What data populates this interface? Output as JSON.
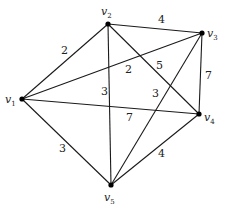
{
  "graph": {
    "type": "weighted-undirected-graph",
    "vertices": [
      {
        "id": "v1",
        "name": "v",
        "sub": "1",
        "x": 22,
        "y": 99,
        "label_x": 5,
        "label_y": 103
      },
      {
        "id": "v2",
        "name": "v",
        "sub": "2",
        "x": 108,
        "y": 24,
        "label_x": 101,
        "label_y": 15
      },
      {
        "id": "v3",
        "name": "v",
        "sub": "3",
        "x": 202,
        "y": 33,
        "label_x": 207,
        "label_y": 37
      },
      {
        "id": "v4",
        "name": "v",
        "sub": "4",
        "x": 199,
        "y": 114,
        "label_x": 204,
        "label_y": 121
      },
      {
        "id": "v5",
        "name": "v",
        "sub": "5",
        "x": 111,
        "y": 185,
        "label_x": 104,
        "label_y": 201
      }
    ],
    "edges": [
      {
        "from": "v1",
        "to": "v2",
        "weight": "2",
        "label_x": 61,
        "label_y": 54
      },
      {
        "from": "v2",
        "to": "v3",
        "weight": "4",
        "label_x": 158,
        "label_y": 23
      },
      {
        "from": "v1",
        "to": "v3",
        "weight": "2",
        "label_x": 125,
        "label_y": 73
      },
      {
        "from": "v2",
        "to": "v4",
        "weight": "5",
        "label_x": 156,
        "label_y": 69
      },
      {
        "from": "v2",
        "to": "v5",
        "weight": "3",
        "label_x": 101,
        "label_y": 95
      },
      {
        "from": "v3",
        "to": "v5",
        "weight": "3",
        "label_x": 152,
        "label_y": 97
      },
      {
        "from": "v3",
        "to": "v4",
        "weight": "7",
        "label_x": 205,
        "label_y": 79
      },
      {
        "from": "v1",
        "to": "v4",
        "weight": "7",
        "label_x": 126,
        "label_y": 121
      },
      {
        "from": "v1",
        "to": "v5",
        "weight": "3",
        "label_x": 59,
        "label_y": 152
      },
      {
        "from": "v4",
        "to": "v5",
        "weight": "4",
        "label_x": 158,
        "label_y": 157
      }
    ]
  },
  "colors": {
    "edge": "#1a1a1a",
    "node": "#000000",
    "text": "#222222",
    "background": "#ffffff"
  }
}
